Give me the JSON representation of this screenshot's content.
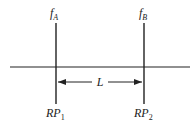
{
  "diagram": {
    "type": "optical-system-reference-planes",
    "elements": [
      {
        "id": "lens-a",
        "label": "f",
        "subscript": "A",
        "bottom_label": "RP",
        "bottom_subscript": "1"
      },
      {
        "id": "lens-b",
        "label": "f",
        "subscript": "B",
        "bottom_label": "RP",
        "bottom_subscript": "2"
      }
    ],
    "distance_label": "L",
    "colors": {
      "line": "#222222",
      "background": "#ffffff"
    }
  }
}
